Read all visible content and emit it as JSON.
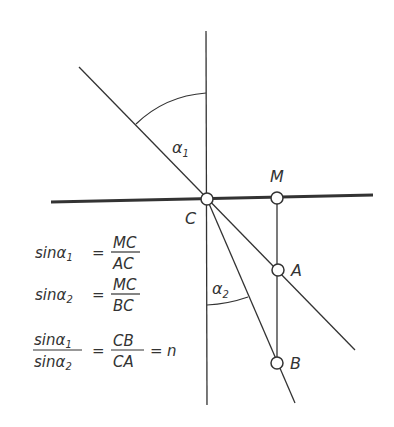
{
  "diagram": {
    "type": "refraction-geometry",
    "points": {
      "C": {
        "label": "C",
        "x": 207,
        "y": 199
      },
      "M": {
        "label": "M",
        "x": 277,
        "y": 198
      },
      "A": {
        "label": "A",
        "x": 278,
        "y": 270
      },
      "B": {
        "label": "B",
        "x": 277,
        "y": 363
      }
    },
    "angles": {
      "alpha1": {
        "symbol": "α",
        "sub": "1"
      },
      "alpha2": {
        "symbol": "α",
        "sub": "2"
      }
    },
    "equations": {
      "eq1": {
        "lhs": "sin",
        "alpha": "α",
        "sub": "1",
        "eq": "=",
        "num": "MC",
        "den": "AC"
      },
      "eq2": {
        "lhs": "sin",
        "alpha": "α",
        "sub": "2",
        "eq": "=",
        "num": "MC",
        "den": "BC"
      },
      "eq3": {
        "num_lhs": "sinα",
        "num_sub": "1",
        "den_lhs": "sinα",
        "den_sub": "2",
        "eq": "=",
        "num": "CB",
        "den": "CA",
        "eq2": "=",
        "rhs": "n"
      }
    },
    "colors": {
      "line": "#333333",
      "background": "#ffffff"
    }
  }
}
